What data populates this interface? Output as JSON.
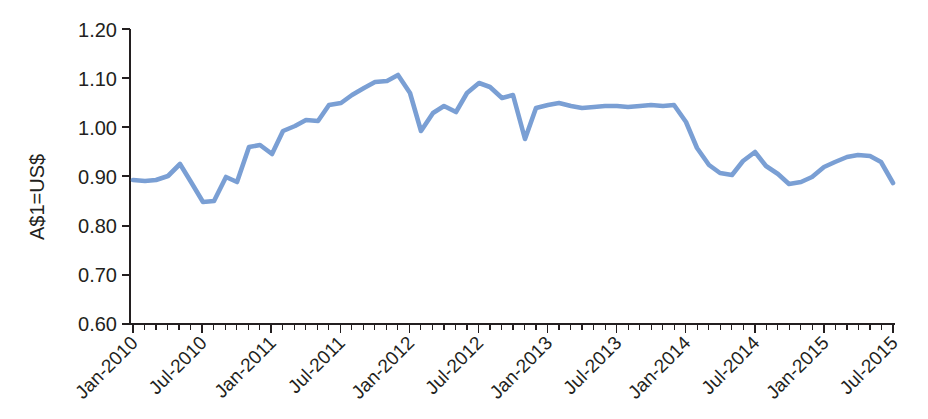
{
  "chart_data": {
    "type": "line",
    "title": "",
    "subtitle": "",
    "xlabel": "",
    "ylabel": "A$1=US$",
    "ylim": [
      0.6,
      1.2
    ],
    "ytick_step": 0.1,
    "ytick_labels": [
      "1.20",
      "1.10",
      "1.00",
      "0.90",
      "0.80",
      "0.70",
      "0.60"
    ],
    "ytick_values": [
      1.2,
      1.1,
      1.0,
      0.9,
      0.8,
      0.7,
      0.6
    ],
    "xtick_labels": [
      "Jan-2010",
      "Jul-2010",
      "Jan-2011",
      "Jul-2011",
      "Jan-2012",
      "Jul-2012",
      "Jan-2013",
      "Jul-2013",
      "Jan-2014",
      "Jul-2014",
      "Jan-2015",
      "Jul-2015"
    ],
    "xtick_label_rotation_deg": -45,
    "xtick_interval_months": 6,
    "minor_tick_interval_months": 1,
    "grid": false,
    "legend": false,
    "legend_position": "none",
    "line_color": "#7a9fd4",
    "axis_color": "#231f20",
    "series": [
      {
        "name": "A$1=US$",
        "x": [
          "Jan-2010",
          "Feb-2010",
          "Mar-2010",
          "Apr-2010",
          "May-2010",
          "Jun-2010",
          "Jul-2010",
          "Aug-2010",
          "Sep-2010",
          "Oct-2010",
          "Nov-2010",
          "Dec-2010",
          "Jan-2011",
          "Feb-2011",
          "Mar-2011",
          "Apr-2011",
          "May-2011",
          "Jun-2011",
          "Jul-2011",
          "Aug-2011",
          "Sep-2011",
          "Oct-2011",
          "Nov-2011",
          "Dec-2011",
          "Jan-2012",
          "Feb-2012",
          "Mar-2012",
          "Apr-2012",
          "May-2012",
          "Jun-2012",
          "Jul-2012",
          "Aug-2012",
          "Sep-2012",
          "Oct-2012",
          "Nov-2012",
          "Dec-2012",
          "Jan-2013",
          "Feb-2013",
          "Mar-2013",
          "Apr-2013",
          "May-2013",
          "Jun-2013",
          "Jul-2013",
          "Aug-2013",
          "Sep-2013",
          "Oct-2013",
          "Nov-2013",
          "Dec-2013",
          "Jan-2014",
          "Feb-2014",
          "Mar-2014",
          "Apr-2014",
          "May-2014",
          "Jun-2014",
          "Jul-2014",
          "Aug-2014",
          "Sep-2014",
          "Oct-2014",
          "Nov-2014",
          "Dec-2014",
          "Jan-2015",
          "Feb-2015",
          "Mar-2015",
          "Apr-2015",
          "May-2015",
          "Jun-2015",
          "Jul-2015"
        ],
        "values": [
          0.894,
          0.893,
          0.895,
          0.905,
          0.93,
          0.892,
          0.855,
          0.855,
          0.9,
          0.892,
          0.96,
          0.965,
          0.945,
          0.99,
          1.0,
          1.01,
          1.008,
          1.04,
          1.045,
          1.06,
          1.075,
          1.085,
          1.088,
          1.098,
          1.06,
          0.985,
          1.02,
          1.035,
          1.022,
          1.06,
          1.08,
          1.073,
          1.05,
          1.055,
          0.972,
          1.035,
          1.042,
          1.045,
          1.04,
          1.035,
          1.038,
          1.04,
          1.04,
          1.038,
          1.04,
          1.042,
          1.04,
          1.042,
          1.008,
          0.955,
          0.92,
          0.905,
          0.9,
          0.93,
          0.95,
          0.92,
          0.905,
          0.885,
          0.888,
          0.9,
          0.92,
          0.93,
          0.94,
          0.945,
          0.942,
          0.93,
          0.888
        ],
        "values_extended": [
          0.882,
          0.865,
          0.84,
          0.79,
          0.785,
          0.8,
          0.785,
          0.79,
          0.775,
          0.735
        ],
        "x_extended": [
          "Aug-2014b",
          "Sep-2014b",
          "Oct-2014b",
          "Nov-2014b",
          "Dec-2014b",
          "Jan-2015b",
          "Feb-2015b",
          "Mar-2015b",
          "Apr-2015b",
          "May-2015b"
        ]
      }
    ],
    "points_px": [
      [
        133,
        180
      ],
      [
        145,
        181
      ],
      [
        156,
        180
      ],
      [
        168,
        176
      ],
      [
        180,
        164
      ],
      [
        191,
        182
      ],
      [
        203,
        202
      ],
      [
        214,
        201
      ],
      [
        226,
        177
      ],
      [
        237,
        182
      ],
      [
        249,
        147
      ],
      [
        260,
        145
      ],
      [
        272,
        154
      ],
      [
        283,
        131
      ],
      [
        295,
        126
      ],
      [
        306,
        120
      ],
      [
        318,
        121
      ],
      [
        329,
        105
      ],
      [
        341,
        103
      ],
      [
        352,
        95
      ],
      [
        364,
        88
      ],
      [
        375,
        82
      ],
      [
        387,
        81
      ],
      [
        398,
        75
      ],
      [
        410,
        93
      ],
      [
        421,
        131
      ],
      [
        433,
        113
      ],
      [
        444,
        106
      ],
      [
        456,
        112
      ],
      [
        467,
        93
      ],
      [
        479,
        83
      ],
      [
        490,
        87
      ],
      [
        502,
        98
      ],
      [
        513,
        95
      ],
      [
        525,
        139
      ],
      [
        536,
        108
      ],
      [
        548,
        105
      ],
      [
        559,
        103
      ],
      [
        571,
        106
      ],
      [
        582,
        108
      ],
      [
        594,
        107
      ],
      [
        605,
        106
      ],
      [
        617,
        106
      ],
      [
        628,
        107
      ],
      [
        640,
        106
      ],
      [
        651,
        105
      ],
      [
        663,
        106
      ],
      [
        674,
        105
      ],
      [
        686,
        122
      ],
      [
        697,
        148
      ],
      [
        709,
        165
      ],
      [
        720,
        173
      ],
      [
        732,
        175
      ],
      [
        743,
        161
      ],
      [
        755,
        152
      ],
      [
        766,
        166
      ],
      [
        778,
        174
      ],
      [
        789,
        184
      ],
      [
        801,
        182
      ],
      [
        812,
        177
      ],
      [
        824,
        167
      ],
      [
        835,
        162
      ],
      [
        847,
        157
      ],
      [
        858,
        155
      ],
      [
        870,
        156
      ],
      [
        881,
        162
      ],
      [
        893,
        183
      ]
    ]
  },
  "axes": {
    "y_axis_name": "A$1=US$",
    "x_axis_name": ""
  }
}
